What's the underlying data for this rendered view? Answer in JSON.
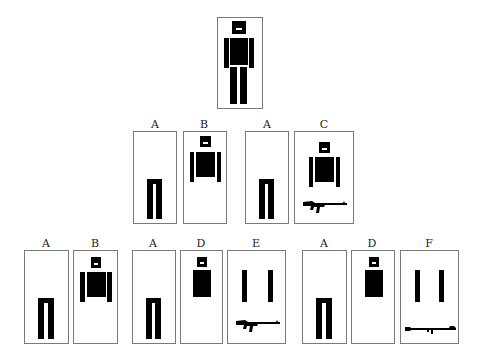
{
  "diagram": {
    "root": {
      "name": "full-figure",
      "parts": [
        "head",
        "torso",
        "arms",
        "legs"
      ]
    },
    "level_1": [
      {
        "label": "A",
        "content": "legs"
      },
      {
        "label": "B",
        "content": "head, torso, arms"
      },
      {
        "label": "A",
        "content": "legs"
      },
      {
        "label": "C",
        "content": "head, torso, arms, rifle"
      }
    ],
    "level_2": [
      {
        "label": "A",
        "content": "legs"
      },
      {
        "label": "B",
        "content": "head, torso, arms"
      },
      {
        "label": "A",
        "content": "legs"
      },
      {
        "label": "D",
        "content": "head, torso"
      },
      {
        "label": "E",
        "content": "arms, rifle"
      },
      {
        "label": "A",
        "content": "legs"
      },
      {
        "label": "D",
        "content": "head, torso"
      },
      {
        "label": "F",
        "content": "arms, rocket launcher"
      }
    ],
    "colors": {
      "figure": "#000000",
      "border": "#7a7a7a",
      "background": "#ffffff"
    }
  }
}
